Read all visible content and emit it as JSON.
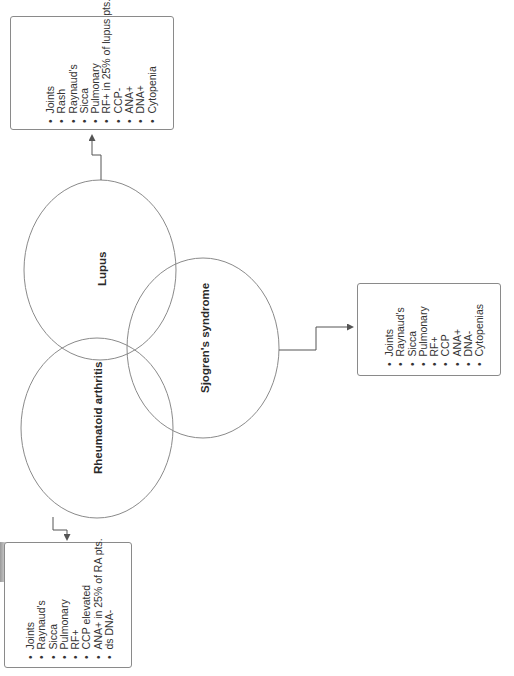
{
  "diagram": {
    "type": "venn",
    "orientation": "rotated -90deg",
    "circles": [
      {
        "id": "lupus",
        "label": "Lupus"
      },
      {
        "id": "sjogren",
        "label": "Sjogren's syndrome"
      },
      {
        "id": "ra",
        "label": "Rheumatoid arthritis"
      }
    ],
    "boxes": {
      "lupus": {
        "items": [
          "Joints",
          "Rash",
          "Raynaud's",
          "Sicca",
          "Pulmonary",
          "RF+ in 25% of lupus pts.",
          "CCP-",
          "ANA+",
          "DNA+",
          "Cytopenia"
        ]
      },
      "sjogren": {
        "items": [
          "Joints",
          "Raynaud's",
          "Sicca",
          "Pulmonary",
          "RF+",
          "CCP",
          "ANA+",
          "DNA-",
          "Cytopenias"
        ]
      },
      "ra": {
        "items": [
          "Joints",
          "Raynaud's",
          "Sicca",
          "Pulmonary",
          "RF+",
          "CCP elevated",
          "ANA+ in 25% of RA pts.",
          "ds DNA-"
        ]
      }
    },
    "colors": {
      "stroke": "#8a8a8a",
      "connector": "#555555",
      "text": "#2a2a2a",
      "background": "#ffffff"
    }
  }
}
